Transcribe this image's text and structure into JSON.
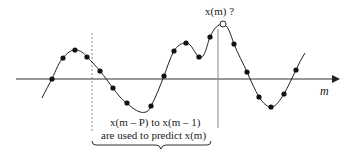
{
  "diagram": {
    "title_label": "x(m) ?",
    "axis_label": "m",
    "caption_line1": "x(m – P) to x(m – 1)",
    "caption_line2": "are used to predict x(m)",
    "colors": {
      "line": "#222222",
      "dots": "#111111",
      "axis": "#333333",
      "dashed": "#888888"
    },
    "samples_filled": [
      [
        52,
        79
      ],
      [
        63,
        58
      ],
      [
        75,
        50
      ],
      [
        87,
        57
      ],
      [
        100,
        71
      ],
      [
        113,
        88
      ],
      [
        127,
        103
      ],
      [
        151,
        106
      ],
      [
        164,
        76
      ],
      [
        174,
        51
      ],
      [
        186,
        43
      ],
      [
        199,
        57
      ],
      [
        210,
        37
      ],
      [
        234,
        44
      ],
      [
        247,
        72
      ],
      [
        259,
        97
      ],
      [
        271,
        107
      ],
      [
        284,
        94
      ],
      [
        296,
        70
      ]
    ],
    "sample_predicted": [
      223,
      24
    ]
  }
}
